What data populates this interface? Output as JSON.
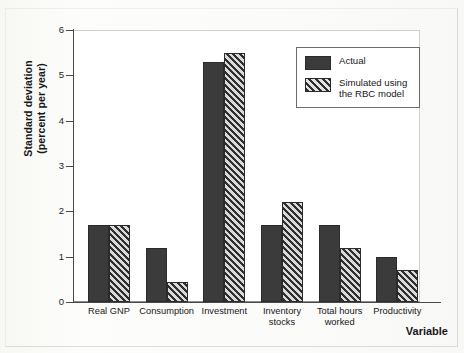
{
  "chart_data": {
    "type": "bar",
    "title": "",
    "xlabel": "Variable",
    "ylabel": "Standard deviation\n(percent per year)",
    "ylim": [
      0,
      6
    ],
    "yticks": [
      0,
      1,
      2,
      3,
      4,
      5,
      6
    ],
    "grid": false,
    "legend_position": "top-right",
    "categories": [
      "Real GNP",
      "Consumption",
      "Investment",
      "Inventory\nstocks",
      "Total hours\nworked",
      "Productivity"
    ],
    "series": [
      {
        "name": "Actual",
        "values": [
          1.7,
          1.2,
          5.3,
          1.7,
          1.7,
          1.0
        ],
        "color": "#3b3b3c",
        "pattern": "solid"
      },
      {
        "name": "Simulated using\nthe RBC model",
        "values": [
          1.7,
          0.45,
          5.5,
          2.2,
          1.2,
          0.7
        ],
        "color": "#6f6f70",
        "pattern": "diagonal-hatch"
      }
    ]
  },
  "axis": {
    "y_title_line1": "Standard deviation",
    "y_title_line2": "(percent per year)",
    "x_title": "Variable",
    "tick_labels": [
      "0",
      "1",
      "2",
      "3",
      "4",
      "5",
      "6"
    ]
  },
  "legend": {
    "items": [
      {
        "label": "Actual",
        "swatch": "solid-dark-swatch"
      },
      {
        "label": "Simulated using\nthe RBC model",
        "swatch": "hatched-swatch"
      }
    ]
  }
}
